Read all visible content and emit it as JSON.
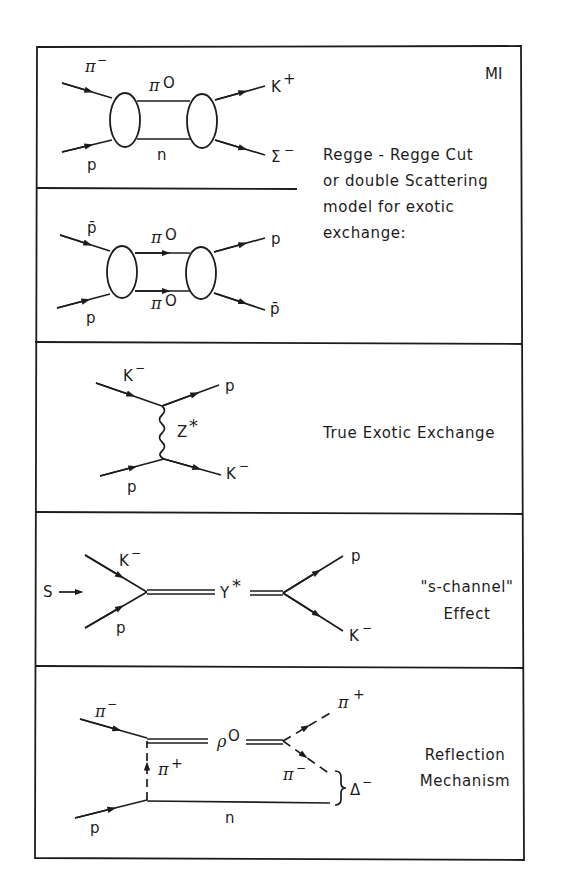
{
  "figure": {
    "label": "MI",
    "panels": [
      {
        "id": "regge-cut-1",
        "particles": {
          "in_top": "π",
          "in_top_sup": "−",
          "in_bottom": "p",
          "exchange_top": "π",
          "exchange_top_sup": "O",
          "exchange_bottom": "n",
          "out_top": "K",
          "out_top_sup": "+",
          "out_bottom": "Σ",
          "out_bottom_sup": "−"
        }
      },
      {
        "id": "regge-cut-2",
        "particles": {
          "in_top": "p̄",
          "in_bottom": "p",
          "exchange_top": "π",
          "exchange_top_sup": "O",
          "exchange_bottom": "π",
          "exchange_bottom_sup": "O",
          "out_top": "p",
          "out_bottom": "p̄"
        }
      },
      {
        "id": "true-exotic",
        "particles": {
          "in_top": "K",
          "in_top_sup": "−",
          "in_bottom": "p",
          "exchange": "Z",
          "exchange_sup": "*",
          "out_top": "p",
          "out_bottom": "K",
          "out_bottom_sup": "−"
        },
        "description": [
          "True Exotic Exchange"
        ]
      },
      {
        "id": "s-channel",
        "particles": {
          "s_label": "S",
          "in_top": "K",
          "in_top_sup": "−",
          "in_bottom": "p",
          "resonance": "Y",
          "resonance_sup": "*",
          "out_top": "p",
          "out_bottom": "K",
          "out_bottom_sup": "−"
        },
        "description": [
          "\"s-channel\"",
          "Effect"
        ]
      },
      {
        "id": "reflection",
        "particles": {
          "in_top": "π",
          "in_top_sup": "−",
          "in_bottom": "p",
          "exchange": "π",
          "exchange_sup": "+",
          "resonance": "ρ",
          "resonance_sup": "O",
          "out_top": "π",
          "out_top_sup": "+",
          "out_mid": "π",
          "out_mid_sup": "−",
          "recoil": "n",
          "system": "Δ",
          "system_sup": "−"
        },
        "description": [
          "Reflection",
          "Mechanism"
        ]
      }
    ],
    "shared_description": [
      "Regge - Regge Cut",
      "or double Scattering",
      "model for exotic",
      "exchange:"
    ]
  }
}
